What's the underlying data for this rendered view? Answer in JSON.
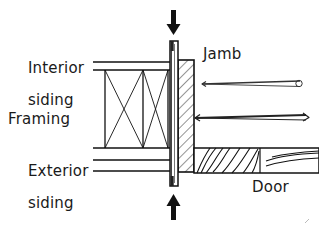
{
  "diagram": {
    "ink_color": "#111111",
    "background": "#ffffff",
    "labels": {
      "interior_siding_line1": "Interior",
      "interior_siding_line2": "siding",
      "framing": "Framing",
      "exterior_siding_line1": "Exterior",
      "exterior_siding_line2": "siding",
      "jamb": "Jamb",
      "door": "Door"
    },
    "annotations": {
      "top_arrow": "down-arrow-load-indicator",
      "bottom_arrow": "up-arrow-load-indicator",
      "upper_fastener": "screw-pointing-left",
      "lower_fastener": "screw-pointing-left"
    },
    "components": [
      {
        "name": "interior-siding",
        "type": "double-horizontal-lines"
      },
      {
        "name": "framing-cavity",
        "type": "x-braced-cells",
        "cells": 2
      },
      {
        "name": "exterior-siding",
        "type": "triple-horizontal-lines"
      },
      {
        "name": "jamb-block",
        "type": "hatched-rectangle"
      },
      {
        "name": "weatherstrip",
        "type": "vertical-narrow-strip"
      },
      {
        "name": "door-slab",
        "type": "wood-grain-panel"
      }
    ]
  }
}
